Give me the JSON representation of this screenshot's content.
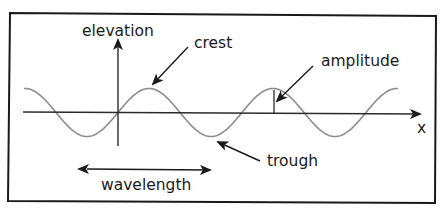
{
  "diagram": {
    "labels": {
      "elevation": "elevation",
      "crest": "crest",
      "amplitude": "amplitude",
      "x_axis": "x",
      "trough": "trough",
      "wavelength": "wavelength"
    },
    "colors": {
      "frame": "#1a1a1a",
      "axes": "#2a2a2a",
      "wave": "#8c8c8c",
      "text": "#1a1a1a",
      "background": "#ffffff"
    },
    "wave": {
      "shape": "sine",
      "cycles_shown": 2.75
    }
  }
}
